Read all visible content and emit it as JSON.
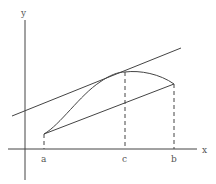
{
  "diagram": {
    "axes": {
      "x_label": "x",
      "y_label": "y"
    },
    "tick_labels": {
      "a": "a",
      "c": "c",
      "b": "b"
    },
    "colors": {
      "line": "#444444",
      "label": "#555555",
      "background": "#ffffff"
    },
    "elements": [
      {
        "name": "curve",
        "from": "a",
        "through": "c",
        "to": "b"
      },
      {
        "name": "secant-line",
        "through": [
          "a",
          "b"
        ]
      },
      {
        "name": "tangent-line",
        "at": "c",
        "parallel_to": "secant-line"
      },
      {
        "name": "dashed-drop-a",
        "style": "dashed"
      },
      {
        "name": "dashed-drop-c",
        "style": "dashed"
      },
      {
        "name": "dashed-drop-b",
        "style": "dashed"
      }
    ]
  }
}
